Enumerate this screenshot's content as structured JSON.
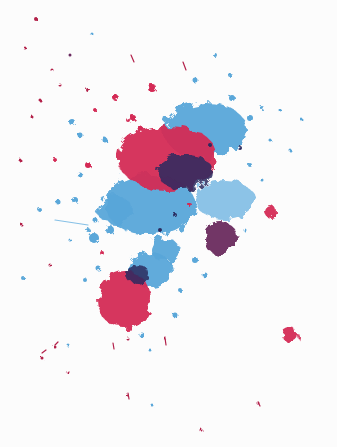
{
  "image": {
    "subject": "ink splatter",
    "width": 337,
    "height": 447,
    "background": "#fcfcfc"
  },
  "colors": {
    "red": "#d42a55",
    "red_dark": "#b3204a",
    "blue": "#5aa7d9",
    "blue_light": "#86c0e6",
    "navy": "#2b2a5e",
    "purple": "#6a2a5e"
  },
  "blobs": [
    {
      "name": "blue-splash-upper-right",
      "color": "blue",
      "cx": 205,
      "cy": 130,
      "rx": 42,
      "ry": 28
    },
    {
      "name": "blue-splash-center",
      "color": "blue",
      "cx": 150,
      "cy": 205,
      "rx": 45,
      "ry": 30
    },
    {
      "name": "blue-splash-left",
      "color": "blue",
      "cx": 115,
      "cy": 210,
      "rx": 18,
      "ry": 14
    },
    {
      "name": "blue-splash-mid-low",
      "color": "blue",
      "cx": 165,
      "cy": 250,
      "rx": 14,
      "ry": 12
    },
    {
      "name": "blue-splash-right-mid",
      "color": "blue_light",
      "cx": 225,
      "cy": 200,
      "rx": 30,
      "ry": 20
    },
    {
      "name": "blue-splash-lower",
      "color": "blue",
      "cx": 150,
      "cy": 270,
      "rx": 22,
      "ry": 18
    },
    {
      "name": "red-main-blob",
      "color": "red",
      "cx": 168,
      "cy": 158,
      "rx": 50,
      "ry": 33
    },
    {
      "name": "navy-core-main",
      "color": "navy",
      "cx": 185,
      "cy": 172,
      "rx": 28,
      "ry": 18
    },
    {
      "name": "red-lower-blob",
      "color": "red",
      "cx": 125,
      "cy": 300,
      "rx": 27,
      "ry": 29
    },
    {
      "name": "navy-lower-cap",
      "color": "navy",
      "cx": 138,
      "cy": 275,
      "rx": 12,
      "ry": 10
    },
    {
      "name": "navy-purple-blob",
      "color": "purple",
      "cx": 220,
      "cy": 238,
      "rx": 17,
      "ry": 17
    },
    {
      "name": "red-dot-right",
      "color": "red",
      "cx": 271,
      "cy": 212,
      "rx": 6,
      "ry": 6
    },
    {
      "name": "red-dot-bottom-right",
      "color": "red",
      "cx": 291,
      "cy": 336,
      "rx": 8,
      "ry": 7
    }
  ],
  "droplets": [
    [
      36,
      19,
      2,
      "red_dark"
    ],
    [
      92,
      34,
      1.5,
      "blue"
    ],
    [
      70,
      55,
      1.5,
      "purple"
    ],
    [
      25,
      48,
      1.5,
      "red_dark"
    ],
    [
      152,
      88,
      4,
      "red"
    ],
    [
      115,
      97,
      3,
      "red"
    ],
    [
      95,
      110,
      2,
      "red"
    ],
    [
      88,
      90,
      2,
      "red_dark"
    ],
    [
      133,
      118,
      3,
      "red"
    ],
    [
      72,
      122,
      3,
      "blue"
    ],
    [
      80,
      135,
      2.5,
      "blue"
    ],
    [
      105,
      140,
      2.5,
      "blue"
    ],
    [
      128,
      120,
      2,
      "red"
    ],
    [
      140,
      128,
      2.5,
      "red"
    ],
    [
      60,
      85,
      1.5,
      "red_dark"
    ],
    [
      40,
      100,
      1.5,
      "red_dark"
    ],
    [
      32,
      117,
      1.5,
      "red_dark"
    ],
    [
      52,
      70,
      1.5,
      "red_dark"
    ],
    [
      215,
      55,
      2,
      "blue"
    ],
    [
      230,
      75,
      2,
      "blue"
    ],
    [
      195,
      80,
      2.5,
      "blue"
    ],
    [
      232,
      98,
      3,
      "blue"
    ],
    [
      262,
      108,
      2,
      "blue"
    ],
    [
      250,
      118,
      3,
      "blue"
    ],
    [
      280,
      110,
      1.5,
      "blue"
    ],
    [
      302,
      120,
      1.5,
      "blue"
    ],
    [
      270,
      140,
      1.5,
      "blue"
    ],
    [
      55,
      160,
      2,
      "red"
    ],
    [
      88,
      165,
      3,
      "red"
    ],
    [
      80,
      175,
      2.5,
      "blue"
    ],
    [
      75,
      200,
      3,
      "blue"
    ],
    [
      58,
      202,
      2.5,
      "blue"
    ],
    [
      40,
      210,
      2,
      "blue"
    ],
    [
      95,
      220,
      2.5,
      "blue"
    ],
    [
      88,
      230,
      2,
      "blue"
    ],
    [
      70,
      240,
      1.5,
      "blue"
    ],
    [
      94,
      238,
      5,
      "blue"
    ],
    [
      110,
      230,
      4,
      "blue"
    ],
    [
      98,
      268,
      2.5,
      "blue"
    ],
    [
      85,
      280,
      2,
      "blue"
    ],
    [
      23,
      278,
      2,
      "blue"
    ],
    [
      50,
      265,
      1.5,
      "red_dark"
    ],
    [
      195,
      260,
      3,
      "blue"
    ],
    [
      205,
      275,
      2.5,
      "blue"
    ],
    [
      180,
      290,
      2,
      "blue"
    ],
    [
      175,
      315,
      2.5,
      "blue"
    ],
    [
      250,
      165,
      2,
      "blue"
    ],
    [
      262,
      180,
      1.5,
      "blue"
    ],
    [
      290,
      150,
      1.5,
      "blue"
    ],
    [
      245,
      230,
      1.5,
      "blue"
    ],
    [
      142,
      335,
      2.5,
      "blue"
    ],
    [
      150,
      350,
      1.5,
      "blue"
    ],
    [
      165,
      338,
      1.5,
      "red_dark"
    ],
    [
      128,
      339,
      1.5,
      "red_dark"
    ],
    [
      55,
      347,
      1.5,
      "red_dark"
    ],
    [
      42,
      358,
      1.5,
      "red_dark"
    ],
    [
      68,
      372,
      1.5,
      "red_dark"
    ],
    [
      127,
      395,
      1.5,
      "red_dark"
    ],
    [
      152,
      405,
      1.5,
      "blue"
    ],
    [
      258,
      403,
      1.5,
      "red_dark"
    ],
    [
      201,
      430,
      1.5,
      "red_dark"
    ],
    [
      68,
      345,
      1.5,
      "blue"
    ],
    [
      20,
      160,
      1.5,
      "red_dark"
    ],
    [
      22,
      225,
      1.5,
      "red_dark"
    ],
    [
      102,
      253,
      2,
      "red"
    ],
    [
      190,
      205,
      2,
      "red"
    ],
    [
      210,
      145,
      2,
      "navy"
    ],
    [
      240,
      148,
      2,
      "navy"
    ],
    [
      160,
      230,
      2,
      "navy"
    ],
    [
      175,
      215,
      2,
      "navy"
    ]
  ],
  "streaks": [
    [
      55,
      220,
      88,
      225,
      "blue_light"
    ],
    [
      183,
      62,
      186,
      70,
      "red_dark"
    ],
    [
      131,
      55,
      134,
      62,
      "red_dark"
    ],
    [
      165,
      338,
      166,
      345,
      "red_dark"
    ],
    [
      42,
      353,
      46,
      350,
      "red_dark"
    ],
    [
      55,
      345,
      58,
      342,
      "red_dark"
    ],
    [
      113,
      343,
      114,
      349,
      "red_dark"
    ],
    [
      258,
      402,
      260,
      406,
      "red_dark"
    ],
    [
      128,
      393,
      129,
      399,
      "red_dark"
    ]
  ]
}
